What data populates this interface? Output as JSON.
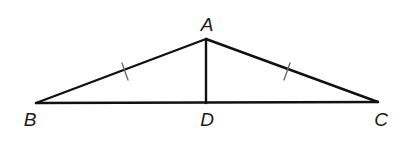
{
  "diagram": {
    "type": "geometry",
    "points": {
      "A": {
        "label": "A",
        "x": 206,
        "y": 39
      },
      "B": {
        "label": "B",
        "x": 36,
        "y": 103
      },
      "C": {
        "label": "C",
        "x": 378,
        "y": 102
      },
      "D": {
        "label": "D",
        "x": 206,
        "y": 103
      }
    },
    "segments": [
      {
        "from": "A",
        "to": "B",
        "congruence_marks": 1
      },
      {
        "from": "A",
        "to": "C",
        "congruence_marks": 1
      },
      {
        "from": "B",
        "to": "C",
        "congruence_marks": 0
      },
      {
        "from": "A",
        "to": "D",
        "congruence_marks": 0
      }
    ],
    "labels": {
      "A": "A",
      "B": "B",
      "C": "C",
      "D": "D"
    },
    "colors": {
      "line": "#111111",
      "tick": "#6a6a6a",
      "background": "#ffffff"
    }
  }
}
